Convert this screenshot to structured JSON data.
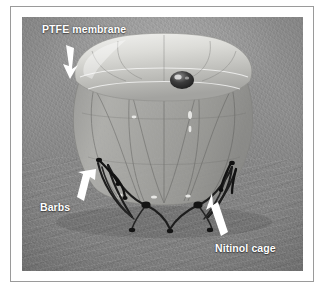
{
  "figure": {
    "type": "photograph",
    "rendering": "grayscale scanning-electron / macro photograph",
    "background_description": "mottled gray substrate with diagonal brushed streaks in the lower half",
    "frame": {
      "mat_color": "#ffffff",
      "rule_color": "#9a9a9a"
    }
  },
  "annotations": [
    {
      "id": "ptfe-membrane",
      "label": "PTFE membrane",
      "color": "#ffffff",
      "arrow_direction": "down-right",
      "points_at": "bright lobed membrane dome at top-left of device"
    },
    {
      "id": "barbs",
      "label": "Barbs",
      "color": "#ffffff",
      "arrow_direction": "up-right",
      "points_at": "small dark hook barbs on the left leg wires"
    },
    {
      "id": "nitinol-cage",
      "label": "Nitinol cage",
      "color": "#ffffff",
      "arrow_direction": "up-left",
      "points_at": "dark zigzag nitinol wire legs at lower-right"
    }
  ],
  "device": {
    "parts": [
      {
        "name": "membrane-dome",
        "description": "bright white lobed PTFE dome forming the top cap"
      },
      {
        "name": "central-hub",
        "description": "small dark metallic knob at the apex center"
      },
      {
        "name": "membrane-body",
        "description": "translucent membrane-covered barrel with faint strut lines"
      },
      {
        "name": "cage-struts",
        "description": "faint darker diamond lattice visible through the membrane"
      },
      {
        "name": "leg-wires",
        "description": "dark nitinol zigzag wire legs extending to the substrate"
      },
      {
        "name": "barb-hooks",
        "description": "short dark anchoring barbs along the legs"
      }
    ]
  },
  "caption": {
    "text": ""
  }
}
